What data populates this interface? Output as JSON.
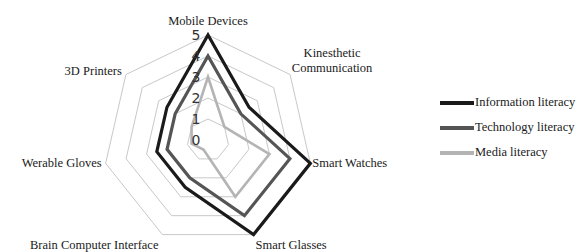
{
  "chart_data": {
    "type": "radar",
    "title": "",
    "categories": [
      "Mobile Devices",
      "Kinesthetic Communication",
      "Smart Watches",
      "Smart Glasses",
      "Brain Computer Interface",
      "Werable Gloves",
      "3D Printers"
    ],
    "category_lines": [
      [
        "Mobile Devices"
      ],
      [
        "Kinesthetic",
        "Communication"
      ],
      [
        "Smart Watches"
      ],
      [
        "Smart Glasses"
      ],
      [
        "Brain Computer Interface"
      ],
      [
        "Werable Gloves"
      ],
      [
        "3D Printers"
      ]
    ],
    "radial_ticks": [
      0,
      1,
      2,
      3,
      4,
      5
    ],
    "rlim": [
      0,
      5
    ],
    "grid": true,
    "legend_position": "right",
    "series": [
      {
        "name": "Information literacy",
        "color": "#1a1a1a",
        "width": 3.2,
        "values": [
          5,
          2.5,
          5,
          5,
          2.5,
          2.5,
          2.5
        ]
      },
      {
        "name": "Technology literacy",
        "color": "#555555",
        "width": 3.2,
        "values": [
          4,
          2,
          4,
          4,
          2,
          2,
          2
        ]
      },
      {
        "name": "Media literacy",
        "color": "#b4b4b4",
        "width": 2.6,
        "values": [
          3,
          1,
          3,
          3,
          0.5,
          0.8,
          1
        ]
      }
    ]
  },
  "legend": {
    "items": [
      {
        "label": "Information literacy",
        "color": "#1a1a1a"
      },
      {
        "label": "Technology literacy",
        "color": "#555555"
      },
      {
        "label": "Media literacy",
        "color": "#b4b4b4"
      }
    ]
  },
  "style": {
    "grid_color": "#c8c8c8",
    "center_x": 208,
    "center_y": 140,
    "radius_per_unit": 21
  }
}
